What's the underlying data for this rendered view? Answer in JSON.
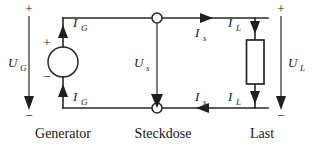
{
  "diagram": {
    "background_color": "#ffffff",
    "line_color": "#262626",
    "text_color": "#1a1a1a"
  },
  "section_labels": [
    {
      "id": "generator",
      "text": "Generator"
    },
    {
      "id": "steckdose",
      "text": "Steckdose"
    },
    {
      "id": "last",
      "text": "Last"
    }
  ],
  "voltages": [
    {
      "id": "u_g",
      "symbol": "U",
      "subscript": "G",
      "plus": "+",
      "minus": "−",
      "direction": "down"
    },
    {
      "id": "u_s",
      "symbol": "U",
      "subscript": "s",
      "plus": "",
      "minus": "",
      "direction": "down"
    },
    {
      "id": "u_l",
      "symbol": "U",
      "subscript": "L",
      "plus": "+",
      "minus": "−",
      "direction": "down"
    }
  ],
  "source": {
    "id": "generator-source",
    "type": "voltage-source-circle",
    "plus": "+",
    "minus": "−"
  },
  "load": {
    "id": "load-resistor",
    "type": "resistor-rectangle"
  },
  "currents": [
    {
      "id": "i_g_top",
      "symbol": "I",
      "subscript": "G",
      "direction": "up"
    },
    {
      "id": "i_g_bottom",
      "symbol": "I",
      "subscript": "G",
      "direction": "up"
    },
    {
      "id": "i_s_top",
      "symbol": "I",
      "subscript": "s",
      "direction": "right"
    },
    {
      "id": "i_s_bottom",
      "symbol": "I",
      "subscript": "s",
      "direction": "left"
    },
    {
      "id": "i_l_top",
      "symbol": "I",
      "subscript": "L",
      "direction": "down"
    },
    {
      "id": "i_l_bottom",
      "symbol": "I",
      "subscript": "L",
      "direction": "down"
    }
  ],
  "nodes": [
    {
      "id": "steckdose-top-node",
      "shape": "circle"
    },
    {
      "id": "steckdose-bottom-node",
      "shape": "circle"
    }
  ]
}
